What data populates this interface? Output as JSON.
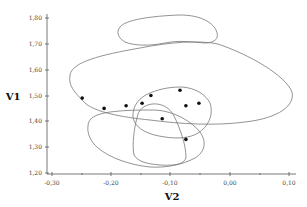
{
  "chart_data": {
    "type": "scatter",
    "title": "",
    "xlabel": "V2",
    "ylabel": "V1",
    "xlim": [
      -0.3,
      0.1
    ],
    "ylim": [
      1.2,
      1.8
    ],
    "x_ticks": [
      "-0,30",
      "-0,20",
      "-0,10",
      "0,00",
      "0,10"
    ],
    "y_ticks": [
      "1,20",
      "1,30",
      "1,40",
      "1,50",
      "1,60",
      "1,70",
      "1,80"
    ],
    "grid": false,
    "legend": null,
    "series": [
      {
        "name": "points",
        "points": [
          {
            "x": -0.249,
            "y": 1.49
          },
          {
            "x": -0.212,
            "y": 1.45
          },
          {
            "x": -0.175,
            "y": 1.46
          },
          {
            "x": -0.148,
            "y": 1.47
          },
          {
            "x": -0.133,
            "y": 1.5
          },
          {
            "x": -0.084,
            "y": 1.52
          },
          {
            "x": -0.074,
            "y": 1.46
          },
          {
            "x": -0.052,
            "y": 1.47
          },
          {
            "x": -0.114,
            "y": 1.41
          },
          {
            "x": -0.074,
            "y": 1.33
          }
        ]
      }
    ],
    "annotations": [
      {
        "type": "contour",
        "name": "top-ellipse",
        "approx_center": {
          "x": -0.1,
          "y": 1.74
        }
      },
      {
        "type": "contour",
        "name": "large-ellipse",
        "approx_center": {
          "x": -0.08,
          "y": 1.56
        }
      },
      {
        "type": "contour",
        "name": "medium-ellipse",
        "approx_center": {
          "x": -0.09,
          "y": 1.45
        }
      },
      {
        "type": "contour",
        "name": "lower-left-ellipse",
        "approx_center": {
          "x": -0.15,
          "y": 1.35
        }
      },
      {
        "type": "contour",
        "name": "narrow-ellipse",
        "approx_center": {
          "x": -0.12,
          "y": 1.35
        }
      }
    ]
  }
}
